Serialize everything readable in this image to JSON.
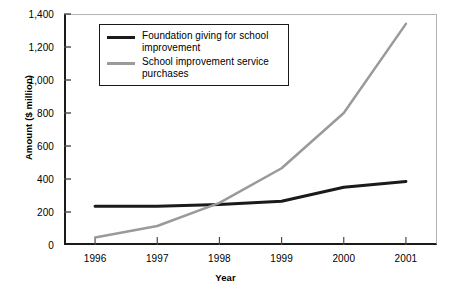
{
  "chart_data": {
    "type": "line",
    "title": "",
    "subtitle": "",
    "xlabel": "Year",
    "ylabel": "Amount ($ million)",
    "categories": [
      "1996",
      "1997",
      "1998",
      "1999",
      "2000",
      "2001"
    ],
    "x": [
      1996,
      1997,
      1998,
      1999,
      2000,
      2001
    ],
    "series": [
      {
        "name": "Foundation giving for school improvement",
        "values": [
          235,
          235,
          245,
          265,
          350,
          385
        ],
        "color": "#1a1a1a",
        "width": 3
      },
      {
        "name": "School improvement service purchases",
        "values": [
          45,
          115,
          255,
          465,
          800,
          1340
        ],
        "color": "#9a9a9a",
        "width": 2.5
      }
    ],
    "ylim": [
      0,
      1400
    ],
    "yticks": [
      0,
      200,
      400,
      600,
      800,
      1000,
      1200,
      1400
    ],
    "ytick_labels": [
      "0",
      "200",
      "400",
      "600",
      "800",
      "1,000",
      "1,200",
      "1,400"
    ],
    "grid": false,
    "legend_position": "upper-left"
  },
  "axes": {
    "y_title": "Amount ($ million)",
    "x_title": "Year",
    "y_tick_labels": [
      "1,400",
      "1,200",
      "1,000",
      "800",
      "600",
      "400",
      "200",
      "0"
    ],
    "x_tick_labels": [
      "1996",
      "1997",
      "1998",
      "1999",
      "2000",
      "2001"
    ]
  },
  "legend": {
    "items": [
      {
        "label": "Foundation giving for school improvement",
        "color": "#1a1a1a"
      },
      {
        "label": "School improvement service purchases",
        "color": "#9a9a9a"
      }
    ]
  }
}
